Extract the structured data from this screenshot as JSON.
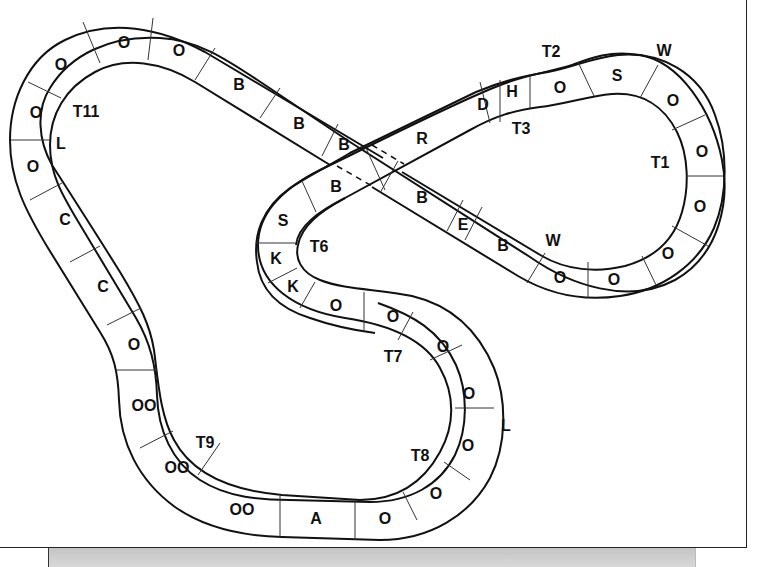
{
  "diagram": {
    "colors": {
      "track_line": "#111111",
      "background": "#ffffff",
      "footer_bar": "#cccccc"
    },
    "segments": [
      {
        "id": "s1",
        "label": "O",
        "x": 61,
        "y": 64
      },
      {
        "id": "s2",
        "label": "O",
        "x": 124,
        "y": 42
      },
      {
        "id": "s3",
        "label": "O",
        "x": 179,
        "y": 50
      },
      {
        "id": "s4",
        "label": "B",
        "x": 239,
        "y": 84
      },
      {
        "id": "s5",
        "label": "B",
        "x": 299,
        "y": 123
      },
      {
        "id": "s6",
        "label": "B",
        "x": 344,
        "y": 144
      },
      {
        "id": "s7",
        "label": "R",
        "x": 422,
        "y": 138
      },
      {
        "id": "s8",
        "label": "D",
        "x": 483,
        "y": 104
      },
      {
        "id": "s9",
        "label": "H",
        "x": 512,
        "y": 91
      },
      {
        "id": "s10",
        "label": "O",
        "x": 560,
        "y": 87
      },
      {
        "id": "s11",
        "label": "S",
        "x": 617,
        "y": 75
      },
      {
        "id": "s12",
        "label": "O",
        "x": 673,
        "y": 100
      },
      {
        "id": "s13",
        "label": "O",
        "x": 702,
        "y": 151
      },
      {
        "id": "s14",
        "label": "O",
        "x": 700,
        "y": 206
      },
      {
        "id": "s15",
        "label": "O",
        "x": 668,
        "y": 253
      },
      {
        "id": "s16",
        "label": "O",
        "x": 614,
        "y": 279
      },
      {
        "id": "s17",
        "label": "O",
        "x": 560,
        "y": 277
      },
      {
        "id": "s18",
        "label": "B",
        "x": 503,
        "y": 245
      },
      {
        "id": "s19",
        "label": "E",
        "x": 463,
        "y": 224
      },
      {
        "id": "s20",
        "label": "B",
        "x": 422,
        "y": 197
      },
      {
        "id": "s21",
        "label": "B",
        "x": 336,
        "y": 186
      },
      {
        "id": "s22",
        "label": "S",
        "x": 283,
        "y": 220
      },
      {
        "id": "s23",
        "label": "K",
        "x": 276,
        "y": 258
      },
      {
        "id": "s24",
        "label": "K",
        "x": 293,
        "y": 286
      },
      {
        "id": "s25",
        "label": "O",
        "x": 336,
        "y": 305
      },
      {
        "id": "s26",
        "label": "O",
        "x": 393,
        "y": 316
      },
      {
        "id": "s27",
        "label": "O",
        "x": 443,
        "y": 346
      },
      {
        "id": "s28",
        "label": "O",
        "x": 469,
        "y": 393
      },
      {
        "id": "s29",
        "label": "O",
        "x": 468,
        "y": 445
      },
      {
        "id": "s30",
        "label": "O",
        "x": 436,
        "y": 493
      },
      {
        "id": "s31",
        "label": "O",
        "x": 385,
        "y": 518
      },
      {
        "id": "s32",
        "label": "A",
        "x": 316,
        "y": 518
      },
      {
        "id": "s33",
        "label": "OO",
        "x": 242,
        "y": 509
      },
      {
        "id": "s34",
        "label": "OO",
        "x": 177,
        "y": 467
      },
      {
        "id": "s35",
        "label": "OO",
        "x": 144,
        "y": 405
      },
      {
        "id": "s36",
        "label": "O",
        "x": 134,
        "y": 344
      },
      {
        "id": "s37",
        "label": "C",
        "x": 103,
        "y": 286
      },
      {
        "id": "s38",
        "label": "C",
        "x": 65,
        "y": 219
      },
      {
        "id": "s39",
        "label": "O",
        "x": 33,
        "y": 166
      },
      {
        "id": "s40",
        "label": "O",
        "x": 36,
        "y": 112
      }
    ],
    "turns": [
      {
        "id": "t1",
        "label": "T1",
        "x": 660,
        "y": 162
      },
      {
        "id": "t2",
        "label": "T2",
        "x": 551,
        "y": 51
      },
      {
        "id": "t3",
        "label": "T3",
        "x": 521,
        "y": 128
      },
      {
        "id": "t6",
        "label": "T6",
        "x": 319,
        "y": 246
      },
      {
        "id": "t7",
        "label": "T7",
        "x": 393,
        "y": 356
      },
      {
        "id": "t8",
        "label": "T8",
        "x": 420,
        "y": 455
      },
      {
        "id": "t9",
        "label": "T9",
        "x": 205,
        "y": 442
      },
      {
        "id": "t11",
        "label": "T11",
        "x": 86,
        "y": 111
      }
    ],
    "markers": [
      {
        "id": "w-top",
        "label": "W",
        "x": 664,
        "y": 50
      },
      {
        "id": "w-bottom",
        "label": "W",
        "x": 553,
        "y": 240
      },
      {
        "id": "l-left",
        "label": "L",
        "x": 61,
        "y": 143
      },
      {
        "id": "l-right",
        "label": "L",
        "x": 506,
        "y": 425
      }
    ]
  }
}
